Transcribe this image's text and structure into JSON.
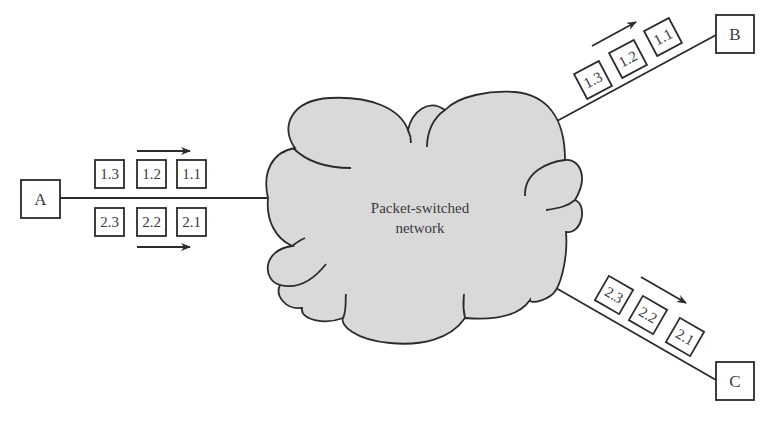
{
  "diagram": {
    "title": "Packet-switched network",
    "cloud": {
      "label_line1": "Packet-switched",
      "label_line2": "network",
      "fill_color": "#d9d9d9",
      "stroke_color": "#2b2b2b"
    },
    "nodes": {
      "a": {
        "label": "A"
      },
      "b": {
        "label": "B"
      },
      "c": {
        "label": "C"
      }
    },
    "link_a": {
      "packets_row1": [
        "1.3",
        "1.2",
        "1.1"
      ],
      "packets_row2": [
        "2.3",
        "2.2",
        "2.1"
      ],
      "arrow_direction": "right"
    },
    "link_b": {
      "packets": [
        "1.3",
        "1.2",
        "1.1"
      ],
      "arrow_direction": "toward B"
    },
    "link_c": {
      "packets": [
        "2.3",
        "2.2",
        "2.1"
      ],
      "arrow_direction": "toward C"
    }
  }
}
